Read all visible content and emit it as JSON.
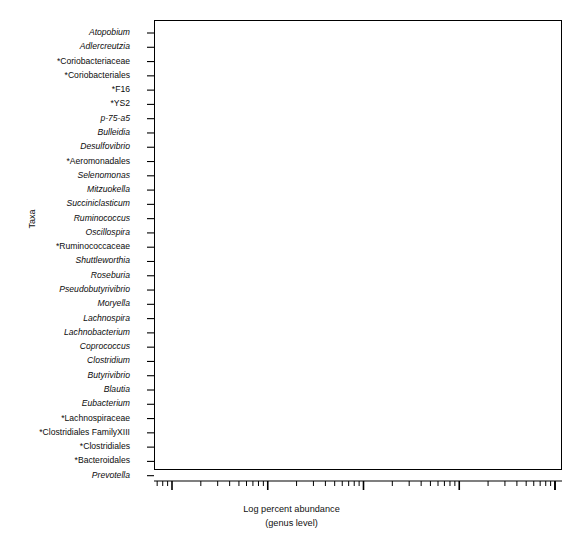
{
  "figure": {
    "width": 583,
    "height": 548,
    "background": "#ffffff",
    "frame_color": "#000000"
  },
  "axis": {
    "y_title": "Taxa",
    "x_title_line1": "Log percent abundance",
    "x_title_line2": "(genus level)",
    "x_tick_labels": [
      ".01",
      ".1",
      "1",
      "10",
      "100"
    ],
    "x_tick_values": [
      0.01,
      0.1,
      1,
      10,
      100
    ],
    "x_scale": "log"
  },
  "chart_data": {
    "type": "box",
    "title": "",
    "xlabel": "Log percent abundance (genus level)",
    "ylabel": "Taxa",
    "xscale": "log",
    "xlim": [
      0.005,
      100
    ],
    "grid": false,
    "legend": false,
    "orientation": "horizontal",
    "categories": [
      "Atopobium",
      "Adlercreutzia",
      "*Coriobacteriaceae",
      "*Coriobacteriales",
      "*F16",
      "*YS2",
      "p-75-a5",
      "Bulleidia",
      "Desulfovibrio",
      "*Aeromonadales",
      "Selenomonas",
      "Mitzuokella",
      "Succiniclasticum",
      "Ruminococcus",
      "Oscillospira",
      "*Ruminococcaceae",
      "Shuttleworthia",
      "Roseburia",
      "Pseudobutyrivibrio",
      "Moryella",
      "Lachnospira",
      "Lachnobacterium",
      "Coprococcus",
      "Clostridium",
      "Butyrivibrio",
      "Blautia",
      "Eubacterium",
      "*Lachnospiraceae",
      "*Clostridiales FamilyXIII",
      "*Clostridiales",
      "*Bacteroidales",
      "Prevotella"
    ],
    "boxes": [
      {
        "taxon": "Atopobium",
        "italic": true,
        "fill": "#1c1c1c",
        "whisker_low": 0.0185,
        "q1": 0.0425,
        "median": 0.063,
        "q3": 0.097,
        "whisker_high": 0.3,
        "outliers": [
          0.0112,
          0.325
        ]
      },
      {
        "taxon": "Adlercreutzia",
        "italic": true,
        "fill": "#1f1f1f",
        "whisker_low": 0.0145,
        "q1": 0.031,
        "median": 0.049,
        "q3": 0.084,
        "whisker_high": 0.285,
        "outliers": [
          0.0072,
          0.31
        ]
      },
      {
        "taxon": "*Coriobacteriaceae",
        "italic": false,
        "fill": "#262626",
        "whisker_low": 0.042,
        "q1": 0.063,
        "median": 0.105,
        "q3": 0.175,
        "whisker_high": 0.72,
        "outliers": [
          0.8,
          0.96
        ]
      },
      {
        "taxon": "*Coriobacteriales",
        "italic": false,
        "fill": "#2b2b2b",
        "whisker_low": 0.03,
        "q1": 0.049,
        "median": 0.069,
        "q3": 0.089,
        "whisker_high": 0.175,
        "outliers": [
          0.0215
        ]
      },
      {
        "taxon": "*F16",
        "italic": false,
        "fill": "#303030",
        "whisker_low": 0.049,
        "q1": 0.082,
        "median": 0.145,
        "q3": 0.175,
        "whisker_high": 0.305,
        "outliers": [
          0.0285,
          0.04
        ]
      },
      {
        "taxon": "*YS2",
        "italic": false,
        "fill": "#525252",
        "whisker_low": 0.069,
        "q1": 0.094,
        "median": 0.142,
        "q3": 0.158,
        "whisker_high": 0.245,
        "outliers": [
          0.043
        ]
      },
      {
        "taxon": "p-75-a5",
        "italic": true,
        "fill": "#b8b8b8",
        "whisker_low": 0.0135,
        "q1": 0.0185,
        "median": 0.0245,
        "q3": 0.036,
        "whisker_high": 0.078,
        "outliers": [
          0.0083,
          0.092
        ]
      },
      {
        "taxon": "Bulleidia",
        "italic": true,
        "fill": "#bcbcbc",
        "whisker_low": 0.082,
        "q1": 0.22,
        "median": 0.33,
        "q3": 0.5,
        "whisker_high": 0.7,
        "outliers": [
          0.057,
          1.55
        ]
      },
      {
        "taxon": "Desulfovibrio",
        "italic": true,
        "fill": "#9e9e9e",
        "whisker_low": 0.0285,
        "q1": 0.052,
        "median": 0.075,
        "q3": 0.112,
        "whisker_high": 0.128,
        "outliers": [
          0.0255,
          0.165
        ]
      },
      {
        "taxon": "*Aeromonadales",
        "italic": false,
        "fill": "#c0c0c0",
        "whisker_low": 0.6,
        "q1": 0.8,
        "median": 2.1,
        "q3": 7.1,
        "whisker_high": 13.5,
        "outliers": [
          0.44,
          22.0
        ]
      },
      {
        "taxon": "Selenomonas",
        "italic": true,
        "fill": "#6e6e6e",
        "whisker_low": 0.36,
        "q1": 0.49,
        "median": 0.75,
        "q3": 1.0,
        "whisker_high": 1.4,
        "outliers": [
          0.3,
          1.65
        ]
      },
      {
        "taxon": "Mitzuokella",
        "italic": true,
        "fill": "#5e5e5e",
        "whisker_low": 0.43,
        "q1": 0.66,
        "median": 0.95,
        "q3": 1.35,
        "whisker_high": 1.85,
        "outliers": [
          2.6
        ]
      },
      {
        "taxon": "Succiniclasticum",
        "italic": true,
        "fill": "#5b5b5b",
        "whisker_low": 1.25,
        "q1": 1.6,
        "median": 2.05,
        "q3": 2.35,
        "whisker_high": 3.15,
        "outliers": [
          4.6
        ]
      },
      {
        "taxon": "Ruminococcus",
        "italic": true,
        "fill": "#575757",
        "whisker_low": 1.0,
        "q1": 1.95,
        "median": 2.45,
        "q3": 2.75,
        "whisker_high": 3.05,
        "outliers": [
          0.72,
          3.3
        ]
      },
      {
        "taxon": "Oscillospira",
        "italic": true,
        "fill": "#5a5a5a",
        "whisker_low": 0.052,
        "q1": 0.082,
        "median": 0.112,
        "q3": 0.145,
        "whisker_high": 0.205,
        "outliers": [
          0.0165,
          0.245
        ]
      },
      {
        "taxon": "*Ruminococcaceae",
        "italic": false,
        "fill": "#636363",
        "whisker_low": 3.3,
        "q1": 4.3,
        "median": 6.1,
        "q3": 8.0,
        "whisker_high": 10.5,
        "outliers": [
          15.5
        ]
      },
      {
        "taxon": "Shuttleworthia",
        "italic": true,
        "fill": "#6b6b6b",
        "whisker_low": 1.45,
        "q1": 2.4,
        "median": 4.4,
        "q3": 7.3,
        "whisker_high": 9.6,
        "outliers": [
          2.05,
          13.5
        ]
      },
      {
        "taxon": "Roseburia",
        "italic": true,
        "fill": "#5f5f5f",
        "whisker_low": 0.37,
        "q1": 0.57,
        "median": 0.8,
        "q3": 1.1,
        "whisker_high": 1.4,
        "outliers": [
          0.3,
          0.34,
          1.55,
          1.75
        ]
      },
      {
        "taxon": "Pseudobutyrivibrio",
        "italic": true,
        "fill": "#6a6a6a",
        "whisker_low": 0.031,
        "q1": 0.05,
        "median": 0.082,
        "q3": 0.135,
        "whisker_high": 0.175,
        "outliers": [
          0.0145,
          0.185,
          0.2
        ]
      },
      {
        "taxon": "Moryella",
        "italic": true,
        "fill": "#5c5c5c",
        "whisker_low": 0.35,
        "q1": 0.52,
        "median": 0.71,
        "q3": 0.96,
        "whisker_high": 1.25,
        "outliers": [
          0.295,
          0.315
        ]
      },
      {
        "taxon": "Lachnospira",
        "italic": true,
        "fill": "#5d5d5d",
        "whisker_low": 0.095,
        "q1": 0.165,
        "median": 0.29,
        "q3": 0.43,
        "whisker_high": 0.55,
        "outliers": [
          0.055
        ]
      },
      {
        "taxon": "Lachnobacterium",
        "italic": true,
        "fill": "#575757",
        "whisker_low": 0.135,
        "q1": 0.19,
        "median": 0.26,
        "q3": 0.36,
        "whisker_high": 0.44,
        "outliers": [
          0.07,
          0.6
        ]
      },
      {
        "taxon": "Coprococcus",
        "italic": true,
        "fill": "#565656",
        "whisker_low": 1.45,
        "q1": 1.95,
        "median": 2.25,
        "q3": 2.55,
        "whisker_high": 2.85,
        "outliers": [
          3.9
        ]
      },
      {
        "taxon": "Clostridium",
        "italic": true,
        "fill": "#5a5a5a",
        "whisker_low": 0.155,
        "q1": 0.25,
        "median": 0.44,
        "q3": 0.62,
        "whisker_high": 0.82,
        "outliers": [
          0.105,
          0.89
        ]
      },
      {
        "taxon": "Butyrivibrio",
        "italic": true,
        "fill": "#585858",
        "whisker_low": 3.7,
        "q1": 4.9,
        "median": 5.9,
        "q3": 7.1,
        "whisker_high": 8.4,
        "outliers": [
          2.9,
          9.9
        ]
      },
      {
        "taxon": "Blautia",
        "italic": true,
        "fill": "#5a5a5a",
        "whisker_low": 0.052,
        "q1": 0.082,
        "median": 0.125,
        "q3": 0.175,
        "whisker_high": 0.265,
        "outliers": [
          0.041,
          0.3
        ]
      },
      {
        "taxon": "Eubacterium",
        "italic": true,
        "fill": "#5e5e5e",
        "whisker_low": 0.6,
        "q1": 0.87,
        "median": 1.15,
        "q3": 1.4,
        "whisker_high": 1.95,
        "outliers": [
          0.48
        ]
      },
      {
        "taxon": "*Lachnospiraceae",
        "italic": false,
        "fill": "#636363",
        "whisker_low": 3.7,
        "q1": 5.3,
        "median": 6.3,
        "q3": 7.0,
        "whisker_high": 8.5,
        "outliers": []
      },
      {
        "taxon": "*Clostridiales FamilyXIII",
        "italic": false,
        "fill": "#606060",
        "whisker_low": 0.8,
        "q1": 1.1,
        "median": 1.45,
        "q3": 1.65,
        "whisker_high": 2.05,
        "outliers": []
      },
      {
        "taxon": "*Clostridiales",
        "italic": false,
        "fill": "#565656",
        "whisker_low": 1.35,
        "q1": 1.85,
        "median": 2.45,
        "q3": 2.75,
        "whisker_high": 2.9,
        "outliers": [
          4.3
        ]
      },
      {
        "taxon": "*Bacteroidales",
        "italic": false,
        "fill": "#9a9a9a",
        "whisker_low": 0.105,
        "q1": 0.165,
        "median": 0.215,
        "q3": 0.295,
        "whisker_high": 0.4,
        "outliers": []
      },
      {
        "taxon": "Prevotella",
        "italic": true,
        "fill": "#a0a0a0",
        "whisker_low": 30.0,
        "q1": 40.0,
        "median": 48.0,
        "q3": 58.0,
        "whisker_high": 68.0,
        "outliers": [
          23.0
        ]
      }
    ]
  }
}
